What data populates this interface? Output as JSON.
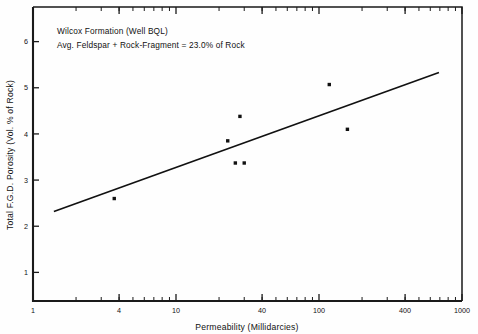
{
  "chart_data": {
    "type": "scatter",
    "title": "",
    "annotations": [
      "Wilcox Formation (Well BQL)",
      "Avg. Feldspar + Rock-Fragment = 23.0% of Rock"
    ],
    "xlabel": "Permeability (Millidarcies)",
    "ylabel": "Total F.G.D. Porosity (Vol. % of Rock)",
    "xscale": "log",
    "yscale": "linear",
    "xlim": [
      1,
      1000
    ],
    "ylim": [
      0.38,
      6.75
    ],
    "xticks": [
      1,
      4,
      10,
      40,
      100,
      400,
      1000
    ],
    "xticklabels": [
      "1",
      "4",
      "10",
      "40",
      "100",
      "400",
      "1000"
    ],
    "yticks": [
      1,
      2,
      3,
      4,
      5,
      6
    ],
    "yticklabels": [
      "1",
      "2",
      "3",
      "4",
      "5",
      "6"
    ],
    "grid": false,
    "legend": false,
    "points": [
      {
        "x": 3.7,
        "y": 2.6
      },
      {
        "x": 23.0,
        "y": 3.85
      },
      {
        "x": 28.0,
        "y": 4.38
      },
      {
        "x": 26.0,
        "y": 3.37
      },
      {
        "x": 30.0,
        "y": 3.37
      },
      {
        "x": 118.0,
        "y": 5.07
      },
      {
        "x": 158.0,
        "y": 4.1
      }
    ],
    "series": [
      {
        "name": "trend-line",
        "type": "line",
        "points": [
          {
            "x": 1.4,
            "y": 2.32
          },
          {
            "x": 690.0,
            "y": 5.33
          }
        ]
      }
    ],
    "marker": {
      "shape": "square",
      "size_px": 3.4,
      "color": "#111111"
    },
    "line_color": "#111111",
    "axis_color": "#1a1a1a",
    "background": "#fefefe"
  }
}
